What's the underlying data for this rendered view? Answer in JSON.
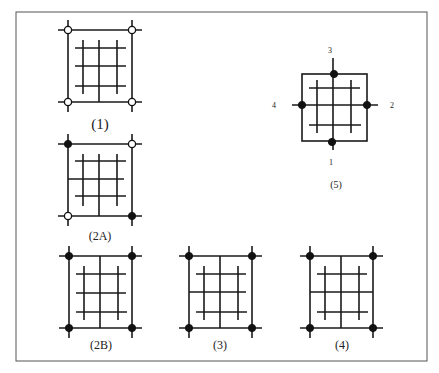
{
  "figure": {
    "frame_color": "#555555",
    "line_color": "#1a1a1a",
    "panels": [
      {
        "id": "1",
        "caption": "(1)",
        "corners": [
          "open",
          "open",
          "open",
          "open"
        ]
      },
      {
        "id": "2A",
        "caption": "(2A)",
        "corners": [
          "filled",
          "open",
          "open",
          "filled"
        ]
      },
      {
        "id": "2B",
        "caption": "(2B)",
        "corners": [
          "filled",
          "filled",
          "filled",
          "filled"
        ]
      },
      {
        "id": "3",
        "caption": "(3)",
        "corners": [
          "filled",
          "filled",
          "filled",
          "filled"
        ]
      },
      {
        "id": "4",
        "caption": "(4)",
        "corners": [
          "filled",
          "filled",
          "filled",
          "filled"
        ]
      },
      {
        "id": "5",
        "caption": "(5)",
        "side_labels": {
          "bottom": "1",
          "right": "2",
          "top": "3",
          "left": "4"
        }
      }
    ],
    "corner_order_note": "top-left, top-right, bottom-left, bottom-right"
  }
}
